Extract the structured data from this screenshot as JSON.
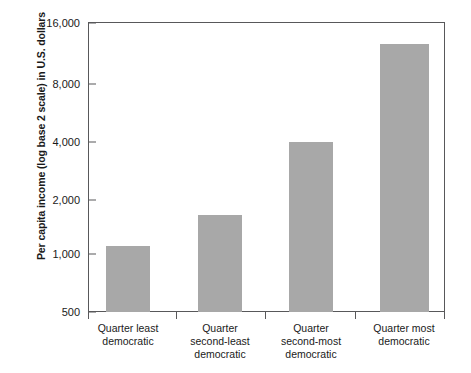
{
  "chart_data": {
    "type": "bar",
    "title": "",
    "xlabel": "",
    "ylabel": "Per capita income (log base 2 scale) in U.S. dollars",
    "categories": [
      "Quarter least\ndemocratic",
      "Quarter\nsecond-least\ndemocratic",
      "Quarter\nsecond-most\ndemocratic",
      "Quarter most\ndemocratic"
    ],
    "values": [
      1100,
      1600,
      3850,
      12500
    ],
    "yticks": [
      500,
      1000,
      2000,
      4000,
      8000,
      16000
    ],
    "ytick_labels": [
      "500",
      "1,000",
      "2,000",
      "4,000",
      "8,000",
      "16,000"
    ],
    "ylim": [
      500,
      16000
    ],
    "yscale": "log2",
    "grid": false,
    "legend": false,
    "bar_color": "#a8a8a8",
    "axis_color": "#58585a"
  },
  "axis": {
    "y_title": "Per capita income (log base 2 scale) in U.S. dollars",
    "y_labels": [
      "16,000",
      "8,000",
      "4,000",
      "2,000",
      "1,000",
      "500"
    ]
  },
  "xlabels": [
    {
      "line1": "Quarter least",
      "line2": "democratic",
      "line3": ""
    },
    {
      "line1": "Quarter",
      "line2": "second-least",
      "line3": "democratic"
    },
    {
      "line1": "Quarter",
      "line2": "second-most",
      "line3": "democratic"
    },
    {
      "line1": "Quarter most",
      "line2": "democratic",
      "line3": ""
    }
  ]
}
